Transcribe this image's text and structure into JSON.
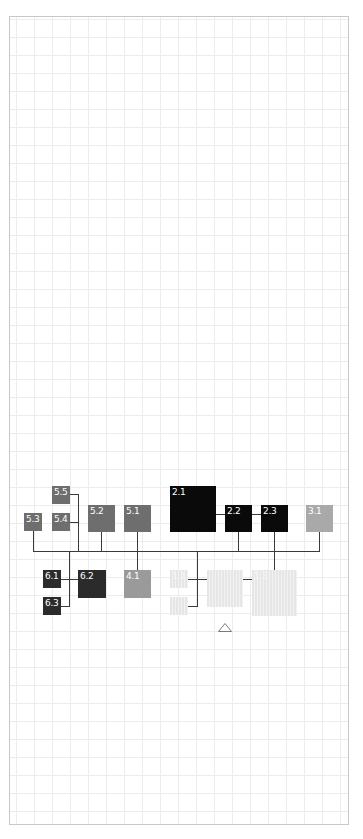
{
  "diagram": {
    "type": "tree / org-chart of numbered boxes on grid paper",
    "nodes": [
      {
        "id": "5.5",
        "label": "5.5",
        "color": "#6e6e6e",
        "x": 52,
        "y": 486,
        "w": 18,
        "h": 18
      },
      {
        "id": "5.3",
        "label": "5.3",
        "color": "#6e6e6e",
        "x": 24,
        "y": 513,
        "w": 18,
        "h": 18
      },
      {
        "id": "5.4",
        "label": "5.4",
        "color": "#6e6e6e",
        "x": 52,
        "y": 513,
        "w": 18,
        "h": 18
      },
      {
        "id": "5.2",
        "label": "5.2",
        "color": "#6e6e6e",
        "x": 88,
        "y": 505,
        "w": 27,
        "h": 27
      },
      {
        "id": "5.1",
        "label": "5.1",
        "color": "#6e6e6e",
        "x": 124,
        "y": 505,
        "w": 27,
        "h": 27
      },
      {
        "id": "2.1",
        "label": "2.1",
        "color": "#0a0a0a",
        "x": 170,
        "y": 486,
        "w": 46,
        "h": 46
      },
      {
        "id": "2.2",
        "label": "2.2",
        "color": "#0a0a0a",
        "x": 225,
        "y": 505,
        "w": 27,
        "h": 27
      },
      {
        "id": "2.3",
        "label": "2.3",
        "color": "#0a0a0a",
        "x": 261,
        "y": 505,
        "w": 27,
        "h": 27
      },
      {
        "id": "3.1",
        "label": "3.1",
        "color": "#a9a9a9",
        "x": 306,
        "y": 505,
        "w": 27,
        "h": 27
      },
      {
        "id": "6.1",
        "label": "6.1",
        "color": "#2b2b2b",
        "x": 43,
        "y": 570,
        "w": 18,
        "h": 18
      },
      {
        "id": "6.2",
        "label": "6.2",
        "color": "#2b2b2b",
        "x": 78,
        "y": 570,
        "w": 28,
        "h": 28
      },
      {
        "id": "6.3",
        "label": "6.3",
        "color": "#2b2b2b",
        "x": 43,
        "y": 597,
        "w": 18,
        "h": 18
      },
      {
        "id": "4.1",
        "label": "4.1",
        "color": "#9a9a9a",
        "x": 124,
        "y": 570,
        "w": 27,
        "h": 28
      },
      {
        "id": "1.1",
        "label": "1.1",
        "color": "#ebebeb",
        "faint": true,
        "x": 170,
        "y": 570,
        "w": 18,
        "h": 18
      },
      {
        "id": "1.2",
        "label": "",
        "color": "#ebebeb",
        "faint": true,
        "x": 170,
        "y": 597,
        "w": 18,
        "h": 18
      },
      {
        "id": "1.0",
        "label": "",
        "color": "#ebebeb",
        "faint": true,
        "x": 207,
        "y": 570,
        "w": 36,
        "h": 37
      },
      {
        "id": "1.3",
        "label": "1.3",
        "color": "#ebebeb",
        "faint": true,
        "x": 252,
        "y": 570,
        "w": 45,
        "h": 46
      }
    ],
    "lines": [
      {
        "x": 33,
        "y": 551,
        "w": 287,
        "h": 1
      },
      {
        "x": 33,
        "y": 531,
        "w": 1,
        "h": 20
      },
      {
        "x": 70,
        "y": 494,
        "w": 9,
        "h": 1
      },
      {
        "x": 70,
        "y": 522,
        "w": 9,
        "h": 1
      },
      {
        "x": 78,
        "y": 494,
        "w": 1,
        "h": 57
      },
      {
        "x": 101,
        "y": 532,
        "w": 1,
        "h": 19
      },
      {
        "x": 137,
        "y": 532,
        "w": 1,
        "h": 38
      },
      {
        "x": 216,
        "y": 514,
        "w": 9,
        "h": 1
      },
      {
        "x": 252,
        "y": 514,
        "w": 9,
        "h": 1
      },
      {
        "x": 238,
        "y": 532,
        "w": 1,
        "h": 19
      },
      {
        "x": 274,
        "y": 532,
        "w": 1,
        "h": 38
      },
      {
        "x": 319,
        "y": 532,
        "w": 1,
        "h": 19
      },
      {
        "x": 69,
        "y": 551,
        "w": 1,
        "h": 56
      },
      {
        "x": 61,
        "y": 579,
        "w": 17,
        "h": 1
      },
      {
        "x": 61,
        "y": 606,
        "w": 8,
        "h": 1
      },
      {
        "x": 197,
        "y": 551,
        "w": 1,
        "h": 56
      },
      {
        "x": 188,
        "y": 579,
        "w": 19,
        "h": 1
      },
      {
        "x": 188,
        "y": 606,
        "w": 9,
        "h": 1
      },
      {
        "x": 243,
        "y": 579,
        "w": 9,
        "h": 1
      }
    ],
    "marker": {
      "shape": "triangle-outline",
      "x": 218,
      "y": 617,
      "w": 14,
      "h": 9,
      "color": "#7a7a7a"
    }
  }
}
